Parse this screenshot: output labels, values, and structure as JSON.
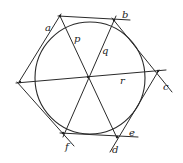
{
  "diagram": {
    "labels": {
      "a": "a",
      "b": "b",
      "c": "c",
      "d": "d",
      "e": "e",
      "f": "f",
      "p": "p",
      "q": "q",
      "r": "r"
    },
    "stroke_color": "#2a2a2a",
    "background": "#ffffff"
  }
}
